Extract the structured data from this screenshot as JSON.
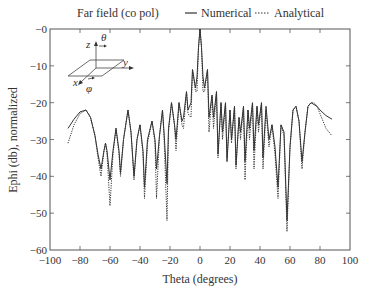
{
  "chart_data": {
    "type": "line",
    "title": "Far field (co pol)",
    "xlabel": "Theta (degrees)",
    "ylabel": "Ephi (db), normalized",
    "xlim": [
      -100,
      100
    ],
    "ylim": [
      -60,
      0
    ],
    "xticks": [
      -100,
      -80,
      -60,
      -40,
      -20,
      0,
      20,
      40,
      60,
      80,
      100
    ],
    "xtick_labels": [
      "−100",
      "−80",
      "−60",
      "−40",
      "−20",
      "0",
      "20",
      "40",
      "60",
      "80",
      "100"
    ],
    "yticks": [
      0,
      -10,
      -20,
      -30,
      -40,
      -50,
      -60
    ],
    "ytick_labels": [
      "−0",
      "−10",
      "−20",
      "−30",
      "−40",
      "−50",
      "−60"
    ],
    "grid": false,
    "legend_position": "top",
    "legend": [
      "Numerical",
      "Analytical"
    ],
    "series": [
      {
        "name": "Numerical",
        "style": "solid",
        "x": [
          -88,
          -84,
          -80,
          -76,
          -73,
          -70,
          -68,
          -66,
          -64,
          -63,
          -62,
          -60,
          -58,
          -56,
          -54,
          -53,
          -51,
          -48,
          -46,
          -44,
          -42,
          -40,
          -38,
          -37,
          -35,
          -32,
          -30,
          -29,
          -27,
          -25,
          -24,
          -22,
          -21,
          -19,
          -17,
          -16,
          -14,
          -12,
          -11,
          -9,
          -8,
          -6,
          -5,
          -3,
          -2,
          -1,
          0,
          1,
          2,
          3,
          5,
          6,
          8,
          9,
          11,
          12,
          14,
          15,
          17,
          18,
          20,
          21,
          23,
          24,
          26,
          27,
          29,
          30,
          32,
          33,
          35,
          36,
          38,
          39,
          41,
          42,
          44,
          46,
          48,
          50,
          52,
          54,
          56,
          58,
          60,
          62,
          64,
          66,
          68,
          70,
          72,
          74,
          76,
          78,
          80,
          84,
          88
        ],
        "y": [
          -27,
          -24.5,
          -22.5,
          -22,
          -24,
          -29,
          -34,
          -38,
          -33,
          -31,
          -33,
          -41,
          -33,
          -27,
          -33,
          -39,
          -30,
          -22,
          -28,
          -40,
          -30,
          -26,
          -33,
          -43,
          -30,
          -25,
          -30,
          -38,
          -29,
          -22,
          -28,
          -42,
          -27,
          -20,
          -26,
          -30,
          -20,
          -25,
          -24,
          -17,
          -22,
          -20,
          -11,
          -16,
          -13,
          -5,
          0,
          -5,
          -13,
          -16,
          -11,
          -24,
          -18,
          -24,
          -17,
          -34,
          -20,
          -28,
          -20,
          -36,
          -22,
          -30,
          -21,
          -37,
          -24,
          -28,
          -21,
          -36,
          -22,
          -27,
          -20,
          -33,
          -21,
          -26,
          -20,
          -35,
          -21,
          -30,
          -26,
          -32,
          -43,
          -26,
          -28,
          -52,
          -32,
          -22,
          -21,
          -25,
          -36,
          -28,
          -21,
          -20,
          -20.5,
          -21,
          -22,
          -23.5,
          -24.5
        ]
      },
      {
        "name": "Analytical",
        "style": "dotted",
        "x": [
          -88,
          -84,
          -80,
          -76,
          -73,
          -70,
          -68,
          -66,
          -64,
          -63,
          -62,
          -60,
          -58,
          -56,
          -54,
          -53,
          -51,
          -48,
          -46,
          -44,
          -42,
          -40,
          -38,
          -37,
          -35,
          -32,
          -30,
          -29,
          -27,
          -25,
          -24,
          -22,
          -21,
          -19,
          -17,
          -16,
          -14,
          -12,
          -11,
          -9,
          -8,
          -6,
          -5,
          -3,
          -2,
          -1,
          0,
          1,
          2,
          3,
          5,
          6,
          8,
          9,
          11,
          12,
          14,
          15,
          17,
          18,
          20,
          21,
          23,
          24,
          26,
          27,
          29,
          30,
          32,
          33,
          35,
          36,
          38,
          39,
          41,
          42,
          44,
          46,
          48,
          50,
          52,
          54,
          56,
          58,
          60,
          62,
          64,
          66,
          68,
          70,
          72,
          74,
          76,
          78,
          80,
          84,
          88
        ],
        "y": [
          -31,
          -26,
          -23,
          -22,
          -24,
          -29,
          -35,
          -40,
          -33,
          -31,
          -34,
          -48,
          -34,
          -27,
          -34,
          -40,
          -30,
          -22,
          -28,
          -41,
          -30,
          -26,
          -34,
          -46,
          -31,
          -25,
          -31,
          -46,
          -29,
          -22,
          -29,
          -52,
          -28,
          -20,
          -26,
          -33,
          -20,
          -26,
          -27,
          -17,
          -23,
          -24,
          -11,
          -17,
          -17,
          -5,
          0,
          -5,
          -17,
          -17,
          -11,
          -28,
          -18,
          -27,
          -17,
          -35,
          -20,
          -30,
          -20,
          -35,
          -22,
          -31,
          -21,
          -38,
          -24,
          -30,
          -21,
          -41,
          -22,
          -30,
          -20,
          -38,
          -21,
          -28,
          -20,
          -38,
          -22,
          -32,
          -26,
          -34,
          -46,
          -26,
          -29,
          -55,
          -32,
          -22,
          -21,
          -25,
          -38,
          -28,
          -21,
          -20,
          -20,
          -21,
          -23,
          -27,
          -29
        ]
      }
    ],
    "annotations": [
      "z",
      "θ",
      "y",
      "x",
      "φ"
    ]
  },
  "header": {
    "title": "Far field (co pol)",
    "legend": {
      "numerical_label": "Numerical",
      "analytical_label": "Analytical"
    }
  },
  "inset": {
    "z_label": "z",
    "theta_label": "θ",
    "y_label": "y",
    "x_label": "x",
    "phi_label": "φ"
  },
  "colors": {
    "axis": "#555555",
    "line": "#333333",
    "text": "#333333"
  }
}
